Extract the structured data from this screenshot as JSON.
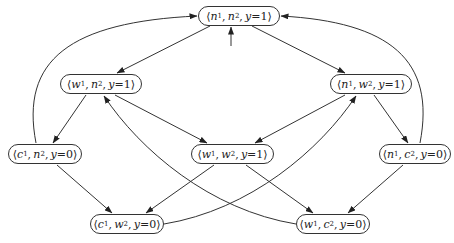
{
  "diagram": {
    "type": "state-transition-graph",
    "nodes": [
      {
        "id": "n1n2",
        "label": "⟨n1, n2, y=1⟩",
        "a": "n",
        "ai": "1",
        "b": "n",
        "bi": "2",
        "y": "y=1",
        "x": 198,
        "top": 6,
        "w": 82,
        "initial": true
      },
      {
        "id": "w1n2",
        "label": "⟨w1, n2, y=1⟩",
        "a": "w",
        "ai": "1",
        "b": "n",
        "bi": "2",
        "y": "y=1",
        "x": 60,
        "top": 74,
        "w": 82
      },
      {
        "id": "n1w2",
        "label": "⟨n1, w2, y=1⟩",
        "a": "n",
        "ai": "1",
        "b": "w",
        "bi": "2",
        "y": "y=1",
        "x": 330,
        "top": 74,
        "w": 82
      },
      {
        "id": "c1n2",
        "label": "⟨c1, n2, y=0⟩",
        "a": "c",
        "ai": "1",
        "b": "n",
        "bi": "2",
        "y": "y=0",
        "x": 8,
        "top": 144,
        "w": 74
      },
      {
        "id": "w1w2",
        "label": "⟨w1, w2, y=1⟩",
        "a": "w",
        "ai": "1",
        "b": "w",
        "bi": "2",
        "y": "y=1",
        "x": 191,
        "top": 144,
        "w": 83
      },
      {
        "id": "n1c2",
        "label": "⟨n1, c2, y=0⟩",
        "a": "n",
        "ai": "1",
        "b": "c",
        "bi": "2",
        "y": "y=0",
        "x": 379,
        "top": 144,
        "w": 72
      },
      {
        "id": "c1w2",
        "label": "⟨c1, w2, y=0⟩",
        "a": "c",
        "ai": "1",
        "b": "w",
        "bi": "2",
        "y": "y=0",
        "x": 90,
        "top": 214,
        "w": 74
      },
      {
        "id": "w1c2",
        "label": "⟨w1, c2, y=0⟩",
        "a": "w",
        "ai": "1",
        "b": "c",
        "bi": "2",
        "y": "y=0",
        "x": 296,
        "top": 214,
        "w": 74
      }
    ],
    "edges": [
      {
        "from": "n1n2",
        "to": "w1n2"
      },
      {
        "from": "n1n2",
        "to": "n1w2"
      },
      {
        "from": "w1n2",
        "to": "c1n2"
      },
      {
        "from": "w1n2",
        "to": "w1w2"
      },
      {
        "from": "n1w2",
        "to": "w1w2"
      },
      {
        "from": "n1w2",
        "to": "n1c2"
      },
      {
        "from": "c1n2",
        "to": "n1n2",
        "curved": true
      },
      {
        "from": "c1n2",
        "to": "c1w2"
      },
      {
        "from": "w1w2",
        "to": "c1w2"
      },
      {
        "from": "w1w2",
        "to": "w1c2"
      },
      {
        "from": "n1c2",
        "to": "n1n2",
        "curved": true
      },
      {
        "from": "n1c2",
        "to": "w1c2"
      },
      {
        "from": "c1w2",
        "to": "n1w2",
        "curved": true
      },
      {
        "from": "w1c2",
        "to": "w1n2",
        "curved": true
      }
    ],
    "colors": {
      "stroke": "#333333",
      "background": "#ffffff"
    }
  }
}
